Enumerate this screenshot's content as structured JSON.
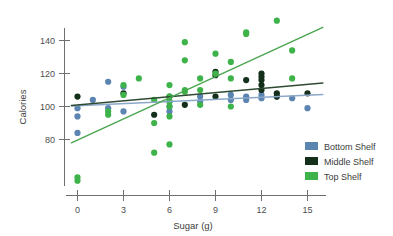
{
  "chart_data": {
    "type": "scatter",
    "title": "",
    "subtitle": "",
    "xlabel": "Sugar (g)",
    "ylabel": "Calories",
    "xlim": [
      -0.8,
      16.2
    ],
    "ylim": [
      52,
      155
    ],
    "grid": false,
    "legend_position": "bottom-right",
    "xticks": [
      0,
      3,
      6,
      9,
      12,
      15
    ],
    "xtick_labels": [
      "0",
      "3",
      "6",
      "9",
      "12",
      "15"
    ],
    "yticks": [
      80,
      100,
      120,
      140
    ],
    "ytick_labels": [
      "80",
      "100",
      "120",
      "140"
    ],
    "colors": {
      "bottom_shelf": "#5b84b1",
      "middle_shelf": "#14301b",
      "top_shelf": "#3eb34a",
      "bottom_trend": "#8ba8c9",
      "middle_trend": "#2f4a33",
      "top_trend": "#4aa54f",
      "axis": "#6f6f6f",
      "text": "#3d3d3d",
      "background": "#ffffff"
    },
    "series": [
      {
        "name": "Bottom Shelf",
        "color": "#5b84b1",
        "points": [
          [
            0,
            99
          ],
          [
            0,
            94
          ],
          [
            0,
            84
          ],
          [
            1,
            104
          ],
          [
            2,
            115
          ],
          [
            2,
            99
          ],
          [
            3,
            112
          ],
          [
            3,
            97
          ],
          [
            6,
            103
          ],
          [
            6,
            100
          ],
          [
            6,
            97
          ],
          [
            8,
            106
          ],
          [
            8,
            103
          ],
          [
            10,
            107
          ],
          [
            10,
            104
          ],
          [
            11,
            106
          ],
          [
            11,
            104
          ],
          [
            12,
            107
          ],
          [
            12,
            105
          ],
          [
            13,
            106
          ],
          [
            14,
            105
          ],
          [
            15,
            99
          ]
        ],
        "trend": {
          "x0": -0.4,
          "y0": 100.3,
          "x1": 16.0,
          "y1": 107.3
        }
      },
      {
        "name": "Middle Shelf",
        "color": "#14301b",
        "points": [
          [
            0,
            106
          ],
          [
            3,
            108
          ],
          [
            5,
            95
          ],
          [
            6,
            106
          ],
          [
            7,
            101
          ],
          [
            9,
            121
          ],
          [
            9,
            119
          ],
          [
            9,
            106
          ],
          [
            11,
            116
          ],
          [
            12,
            120
          ],
          [
            12,
            118
          ],
          [
            12,
            116
          ],
          [
            12,
            113
          ],
          [
            12,
            110
          ],
          [
            13,
            108
          ],
          [
            13,
            106
          ],
          [
            15,
            108
          ]
        ],
        "trend": {
          "x0": -0.4,
          "y0": 100.6,
          "x1": 16.0,
          "y1": 114.2
        }
      },
      {
        "name": "Top Shelf",
        "color": "#3eb34a",
        "points": [
          [
            0,
            57
          ],
          [
            0,
            55
          ],
          [
            2,
            97
          ],
          [
            2,
            95
          ],
          [
            3,
            113
          ],
          [
            3,
            107
          ],
          [
            4,
            117
          ],
          [
            5,
            104
          ],
          [
            5,
            90
          ],
          [
            5,
            72
          ],
          [
            6,
            113
          ],
          [
            6,
            106
          ],
          [
            6,
            103
          ],
          [
            6,
            100
          ],
          [
            6,
            94
          ],
          [
            6,
            77
          ],
          [
            7,
            139
          ],
          [
            7,
            128
          ],
          [
            7,
            110
          ],
          [
            7,
            109
          ],
          [
            8,
            117
          ],
          [
            8,
            110
          ],
          [
            8,
            101
          ],
          [
            9,
            132
          ],
          [
            9,
            120
          ],
          [
            10,
            127
          ],
          [
            10,
            117
          ],
          [
            10,
            100
          ],
          [
            11,
            145
          ],
          [
            11,
            144
          ],
          [
            13,
            152
          ],
          [
            14,
            134
          ],
          [
            14,
            117
          ]
        ],
        "trend": {
          "x0": -0.4,
          "y0": 78.0,
          "x1": 16.0,
          "y1": 148.0
        }
      }
    ]
  },
  "legend": {
    "items": [
      {
        "label": "Bottom Shelf",
        "color": "#5b84b1"
      },
      {
        "label": "Middle Shelf",
        "color": "#14301b"
      },
      {
        "label": "Top Shelf",
        "color": "#3eb34a"
      }
    ]
  }
}
